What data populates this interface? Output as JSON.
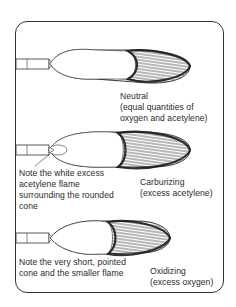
{
  "diagram": {
    "flames": [
      {
        "name": "Neutral",
        "description": "(equal quantities of",
        "description_line2": "oxygen and acetylene)",
        "note": ""
      },
      {
        "name": "Carburizing",
        "description": "(excess acetylene)",
        "note_lines": [
          "Note the white excess",
          "acetylene flame",
          "surrounding the rounded",
          "cone"
        ]
      },
      {
        "name": "Oxidizing",
        "description": "(excess oxygen)",
        "note_lines": [
          "Note the very short, pointed",
          "cone and the smaller flame"
        ]
      }
    ],
    "colors": {
      "ink": "#222222",
      "background": "#ffffff"
    }
  }
}
